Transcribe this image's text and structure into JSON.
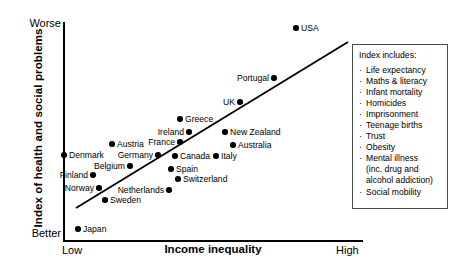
{
  "chart_data": {
    "type": "scatter",
    "title": "",
    "xlabel": "Income inequality",
    "ylabel": "Index of health and social problems",
    "x_tick_labels": [
      "Low",
      "High"
    ],
    "y_tick_labels": [
      "Worse",
      "Better"
    ],
    "xlim": [
      "Low",
      "High"
    ],
    "ylim": [
      "Better",
      "Worse"
    ],
    "grid": false,
    "legend_position": "right-inside",
    "trendline": {
      "x0": 76,
      "y0": 208,
      "x1": 348,
      "y1": 42,
      "color": "#000000"
    },
    "points": [
      {
        "label": "USA",
        "x": 296,
        "y": 28,
        "label_side": "right"
      },
      {
        "label": "Portugal",
        "x": 274,
        "y": 78,
        "label_side": "left"
      },
      {
        "label": "UK",
        "x": 240,
        "y": 102,
        "label_side": "left"
      },
      {
        "label": "Greece",
        "x": 180,
        "y": 119,
        "label_side": "right"
      },
      {
        "label": "Ireland",
        "x": 189,
        "y": 132,
        "label_side": "left"
      },
      {
        "label": "New Zealand",
        "x": 225,
        "y": 132,
        "label_side": "right"
      },
      {
        "label": "Austria",
        "x": 112,
        "y": 144,
        "label_side": "right"
      },
      {
        "label": "France",
        "x": 180,
        "y": 142,
        "label_side": "left"
      },
      {
        "label": "Australia",
        "x": 233,
        "y": 145,
        "label_side": "right"
      },
      {
        "label": "Denmark",
        "x": 64,
        "y": 155,
        "label_side": "right"
      },
      {
        "label": "Germany",
        "x": 158,
        "y": 155,
        "label_side": "left"
      },
      {
        "label": "Canada",
        "x": 175,
        "y": 156,
        "label_side": "right"
      },
      {
        "label": "Italy",
        "x": 216,
        "y": 156,
        "label_side": "right"
      },
      {
        "label": "Belgium",
        "x": 130,
        "y": 166,
        "label_side": "left"
      },
      {
        "label": "Spain",
        "x": 171,
        "y": 169,
        "label_side": "right"
      },
      {
        "label": "Finland",
        "x": 93,
        "y": 175,
        "label_side": "left"
      },
      {
        "label": "Switzerland",
        "x": 178,
        "y": 179,
        "label_side": "right"
      },
      {
        "label": "Norway",
        "x": 99,
        "y": 188,
        "label_side": "left"
      },
      {
        "label": "Netherlands",
        "x": 169,
        "y": 190,
        "label_side": "left"
      },
      {
        "label": "Sweden",
        "x": 105,
        "y": 200,
        "label_side": "right"
      },
      {
        "label": "Japan",
        "x": 78,
        "y": 229,
        "label_side": "right"
      }
    ]
  },
  "legend": {
    "title": "Index includes:",
    "bullet": "·",
    "items": [
      {
        "text": "Life expectancy",
        "continuation": []
      },
      {
        "text": "Maths & literacy",
        "continuation": []
      },
      {
        "text": "Infant mortality",
        "continuation": []
      },
      {
        "text": "Homicides",
        "continuation": []
      },
      {
        "text": "Imprisonment",
        "continuation": []
      },
      {
        "text": "Teenage births",
        "continuation": []
      },
      {
        "text": "Trust",
        "continuation": []
      },
      {
        "text": "Obesity",
        "continuation": []
      },
      {
        "text": "Mental illness",
        "continuation": [
          "(inc. drug and",
          "alcohol addiction)"
        ]
      },
      {
        "text": "Social mobility",
        "continuation": []
      }
    ]
  },
  "colors": {
    "point": "#000000",
    "axis": "#000000",
    "trendline": "#000000",
    "legend_border": "#4a4a4a",
    "background": "#ffffff"
  }
}
